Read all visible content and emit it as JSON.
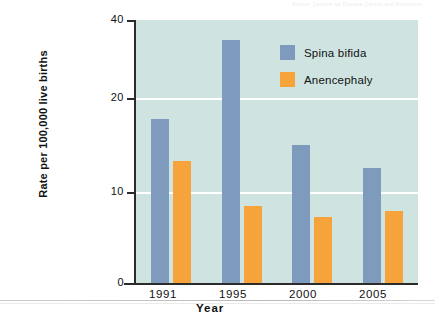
{
  "figure": {
    "background_color": "#ffffff",
    "plot_background_color": "#cfe4e1",
    "scan_artifact_text": "Source: Centers for Disease Control and Prevention"
  },
  "legend": {
    "position": "top-right-inside",
    "entries": [
      {
        "label": "Spina bifida",
        "color": "#7e9bbd"
      },
      {
        "label": "Anencephaly",
        "color": "#f6a33c"
      }
    ]
  },
  "axes": {
    "y_title": "Rate per 100,000 live births",
    "x_title": "Year",
    "y_ticks": [
      "0",
      "10",
      "20",
      "40"
    ],
    "x_ticks": [
      "1991",
      "1995",
      "2000",
      "2005"
    ]
  },
  "chart_data": {
    "type": "bar",
    "title": "",
    "xlabel": "Year",
    "ylabel": "Rate per 100,000 live births",
    "categories": [
      "1991",
      "1995",
      "2000",
      "2005"
    ],
    "series": [
      {
        "name": "Spina bifida",
        "color": "#7e9bbd",
        "values": [
          25,
          37,
          21,
          17.5
        ]
      },
      {
        "name": "Anencephaly",
        "color": "#f6a33c",
        "values": [
          18.5,
          11.7,
          10,
          11
        ]
      }
    ],
    "ylim": [
      0,
      40
    ],
    "ytick_values": [
      0,
      10,
      20,
      40
    ],
    "grid": true,
    "grid_color": "#ffffff",
    "legend_position": "inside top right"
  }
}
